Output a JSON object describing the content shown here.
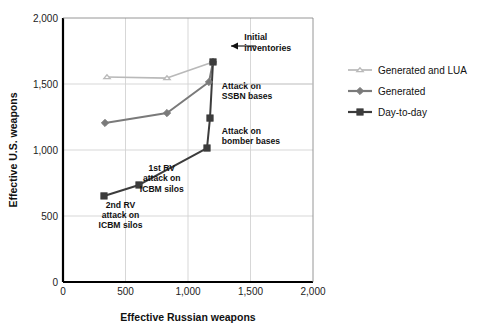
{
  "chart_data": {
    "type": "line",
    "title": "",
    "xlabel": "Effective Russian weapons",
    "ylabel": "Effective U.S. weapons",
    "xlim": [
      0,
      2000
    ],
    "ylim": [
      0,
      2000
    ],
    "xticks": [
      "0",
      "500",
      "1,000",
      "1,500",
      "2,000"
    ],
    "xtick_values": [
      0,
      500,
      1000,
      1500,
      2000
    ],
    "yticks": [
      "0",
      "500",
      "1,000",
      "1,500",
      "2,000"
    ],
    "ytick_values": [
      0,
      500,
      1000,
      1500,
      2000
    ],
    "grid": true,
    "legend_position": "right",
    "series": [
      {
        "name": "Generated and LUA",
        "marker": "triangle",
        "color": "#b9b9b9",
        "points": [
          {
            "x": 352,
            "y": 1553
          },
          {
            "x": 832,
            "y": 1545
          },
          {
            "x": 1200,
            "y": 1667
          }
        ]
      },
      {
        "name": "Generated",
        "marker": "diamond",
        "color": "#7a7a7a",
        "points": [
          {
            "x": 336,
            "y": 1205
          },
          {
            "x": 832,
            "y": 1280
          },
          {
            "x": 1168,
            "y": 1515
          },
          {
            "x": 1200,
            "y": 1667
          }
        ]
      },
      {
        "name": "Day-to-day",
        "marker": "square",
        "color": "#3c3c3c",
        "points": [
          {
            "x": 328,
            "y": 652
          },
          {
            "x": 608,
            "y": 735
          },
          {
            "x": 1152,
            "y": 1015
          },
          {
            "x": 1176,
            "y": 1242
          },
          {
            "x": 1200,
            "y": 1667
          }
        ]
      }
    ],
    "annotations": [
      {
        "id": "initial-inventories",
        "lines": [
          "Initial",
          "inventories"
        ],
        "x": 1450,
        "y": 1830
      },
      {
        "id": "attack-on-ssbn-bases",
        "lines": [
          "Attack on",
          "SSBN bases"
        ],
        "x": 1270,
        "y": 1460
      },
      {
        "id": "attack-on-bomber-bases",
        "lines": [
          "Attack on",
          "bomber bases"
        ],
        "x": 1270,
        "y": 1120
      },
      {
        "id": "first-rv-attack-on-icbm-silos",
        "lines": [
          "1st RV",
          "attack on",
          "ICBM silos"
        ],
        "x": 790,
        "y": 840
      },
      {
        "id": "second-rv-attack-on-icbm-silos",
        "lines": [
          "2nd RV",
          "attack on",
          "ICBM silos"
        ],
        "x": 460,
        "y": 560
      }
    ]
  },
  "legend": {
    "items": [
      {
        "label": "Generated and LUA"
      },
      {
        "label": "Generated"
      },
      {
        "label": "Day-to-day"
      }
    ]
  },
  "axes": {
    "x_title": "Effective Russian weapons",
    "y_title": "Effective U.S. weapons"
  }
}
